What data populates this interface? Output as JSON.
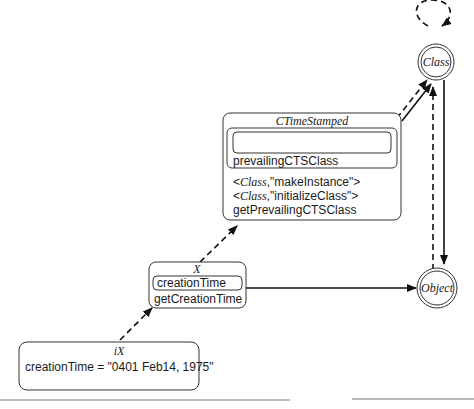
{
  "diagram": {
    "nodes": {
      "class": {
        "label": "Class",
        "shape": "double-circle"
      },
      "object": {
        "label": "Object",
        "shape": "double-circle"
      },
      "ctimestamped": {
        "title": "CTimeStamped",
        "inner_slot_label": "prevailingCTSClass",
        "methods": [
          {
            "prefix": "<",
            "italic": "Class",
            "rest": ",\"makeInstance\">"
          },
          {
            "prefix": "<",
            "italic": "Class",
            "rest": ",\"initializeClass\">"
          },
          {
            "plain": "getPrevailingCTSClass"
          }
        ]
      },
      "x": {
        "title": "X",
        "slot_label": "creationTime",
        "method_label": "getCreationTime"
      },
      "ix": {
        "title": "iX",
        "value_label": "creationTime = \"0401 Feb14, 1975\""
      }
    },
    "edges": [
      {
        "from": "ix",
        "to": "x",
        "style": "dashed",
        "meaning": "instance-of"
      },
      {
        "from": "x",
        "to": "ctimestamped",
        "style": "dashed",
        "meaning": "instance-of"
      },
      {
        "from": "x",
        "to": "object",
        "style": "solid",
        "meaning": "inherits"
      },
      {
        "from": "ctimestamped",
        "to": "class",
        "style": "dashed",
        "meaning": "instance-of"
      },
      {
        "from": "ctimestamped",
        "to": "class",
        "style": "solid",
        "meaning": "inherits"
      },
      {
        "from": "class",
        "to": "class",
        "style": "dashed",
        "meaning": "instance-of (self loop)"
      },
      {
        "from": "class",
        "to": "object",
        "style": "solid",
        "meaning": "inherits"
      },
      {
        "from": "object",
        "to": "class",
        "style": "dashed",
        "meaning": "instance-of"
      }
    ]
  }
}
